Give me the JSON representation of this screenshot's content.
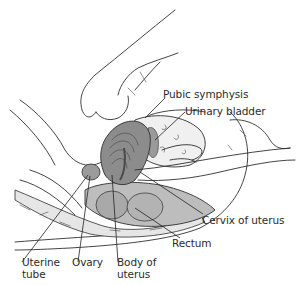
{
  "figure": {
    "type": "anatomical-illustration",
    "colors": {
      "line": "#2f2f2f",
      "uterus_fill": "#8a8a8a",
      "uterus_dark": "#5e5e5e",
      "rectum_fill": "#b8b8b8",
      "bladder_fill": "#e9e9e9",
      "tissue_fill": "#d6d6d6",
      "background": "#ffffff"
    }
  },
  "labels": {
    "pubic_symphysis": "Pubic symphysis",
    "urinary_bladder": "Urinary bladder",
    "cervix_of_uterus": "Cervix of uterus",
    "rectum": "Rectum",
    "uterine_tube_line1": "Uterine",
    "uterine_tube_line2": "tube",
    "ovary": "Ovary",
    "body_of_uterus_line1": "Body of",
    "body_of_uterus_line2": "uterus"
  }
}
